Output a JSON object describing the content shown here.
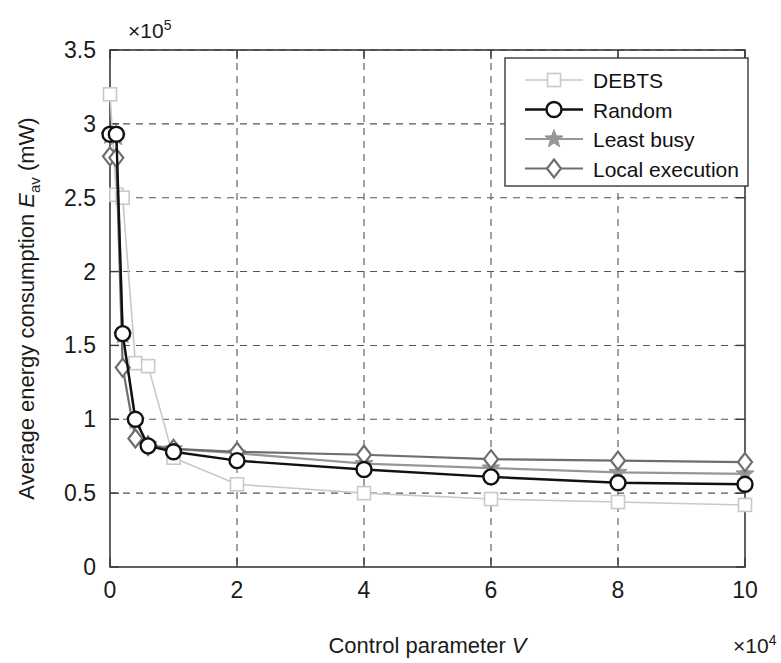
{
  "chart_data": {
    "type": "line",
    "title": "",
    "xlabel": "Control parameter V",
    "ylabel": "Average energy consumption E_av (mW)",
    "ylabel_parts": {
      "main": "Average energy consumption ",
      "symbol": "E",
      "subscript": "av",
      "units": " (mW)"
    },
    "x_exponent_label": "×10",
    "x_exponent_power": "4",
    "y_exponent_label": "×10",
    "y_exponent_power": "5",
    "xlim": [
      0,
      10
    ],
    "ylim": [
      0,
      3.5
    ],
    "x_ticks": [
      0,
      2,
      4,
      6,
      8,
      10
    ],
    "x_tick_labels": [
      "0",
      "2",
      "4",
      "6",
      "8",
      "10"
    ],
    "y_ticks": [
      0,
      0.5,
      1,
      1.5,
      2,
      2.5,
      3,
      3.5
    ],
    "y_tick_labels": [
      "0",
      "0.5",
      "1",
      "1.5",
      "2",
      "2.5",
      "3",
      "3.5"
    ],
    "grid": true,
    "legend_position": "upper right",
    "x_unit_scale": 10000,
    "y_unit_scale": 100000,
    "x": [
      0,
      0.1,
      0.2,
      0.4,
      0.6,
      1,
      2,
      4,
      6,
      8,
      10
    ],
    "series": [
      {
        "name": "DEBTS",
        "color": "#c9c9c9",
        "marker": "square",
        "line_width": 1.6,
        "values": [
          3.2,
          2.52,
          2.5,
          1.38,
          1.36,
          0.74,
          0.56,
          0.5,
          0.46,
          0.44,
          0.42
        ]
      },
      {
        "name": "Random",
        "color": "#111111",
        "marker": "circle",
        "line_width": 2.4,
        "values": [
          2.93,
          2.93,
          1.58,
          1.0,
          0.82,
          0.78,
          0.72,
          0.66,
          0.61,
          0.57,
          0.56
        ]
      },
      {
        "name": "Least busy",
        "color": "#969696",
        "marker": "star",
        "line_width": 2.2,
        "values": [
          2.92,
          2.91,
          1.57,
          0.99,
          0.83,
          0.8,
          0.77,
          0.7,
          0.67,
          0.64,
          0.63
        ]
      },
      {
        "name": "Local execution",
        "color": "#6e6e6e",
        "marker": "diamond",
        "line_width": 2.2,
        "values": [
          2.78,
          2.77,
          1.35,
          0.87,
          0.82,
          0.8,
          0.78,
          0.76,
          0.73,
          0.72,
          0.71
        ]
      }
    ]
  },
  "legend": {
    "entries": [
      "DEBTS",
      "Random",
      "Least busy",
      "Local execution"
    ]
  }
}
